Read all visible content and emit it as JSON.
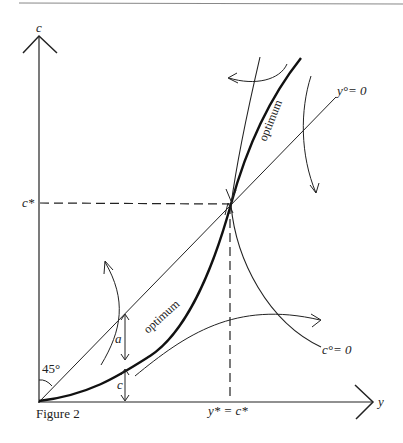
{
  "figure": {
    "caption": "Figure 2",
    "axes": {
      "y_axis_label": "c",
      "x_axis_label": "y"
    },
    "labels": {
      "c_star": "c*",
      "y_star_eq_c_star": "y* = c*",
      "y_dot_zero": "y°= 0",
      "c_dot_zero": "c°= 0",
      "optimum_upper": "optimum",
      "optimum_lower": "optimum",
      "angle": "45°",
      "gap_a": "a",
      "gap_c": "c"
    },
    "colors": {
      "ink": "#222222",
      "background": "#ffffff",
      "rule": "#888888"
    }
  }
}
